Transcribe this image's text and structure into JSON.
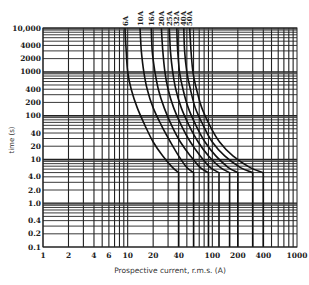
{
  "chart_data": {
    "type": "line",
    "title": "",
    "xlabel": "Prospective current, r.m.s. (A)",
    "ylabel": "time (s)",
    "xscale": "log",
    "yscale": "log",
    "xlim": [
      1,
      1000
    ],
    "ylim": [
      0.1,
      10000
    ],
    "grid": true,
    "legend_position": "curve labels at top",
    "x_tick_labels": [
      "1",
      "2",
      "4",
      "6",
      "10",
      "20",
      "40",
      "100",
      "200",
      "400",
      "1000"
    ],
    "x_ticks": [
      1,
      2,
      4,
      6,
      10,
      20,
      40,
      100,
      200,
      400,
      1000
    ],
    "y_tick_labels": [
      "10,000",
      "4000",
      "2000",
      "1000",
      "400",
      "200",
      "100",
      "40",
      "20",
      "10",
      "4.0",
      "2.0",
      "1.0",
      "0.4",
      "0.2",
      "0.1"
    ],
    "y_ticks": [
      10000,
      4000,
      2000,
      1000,
      400,
      200,
      100,
      40,
      20,
      10,
      4,
      2,
      1,
      0.4,
      0.2,
      0.1
    ],
    "series": [
      {
        "name": "6A",
        "points": [
          [
            9.3,
            10000
          ],
          [
            9.6,
            3000
          ],
          [
            10,
            1000
          ],
          [
            11,
            400
          ],
          [
            13,
            150
          ],
          [
            16,
            60
          ],
          [
            20,
            25
          ],
          [
            26,
            12
          ],
          [
            34,
            6.5
          ],
          [
            40,
            5
          ]
        ],
        "drop_at": 40
      },
      {
        "name": "10A",
        "points": [
          [
            14,
            10000
          ],
          [
            14.5,
            3000
          ],
          [
            15.5,
            1000
          ],
          [
            17,
            400
          ],
          [
            20,
            150
          ],
          [
            25,
            60
          ],
          [
            32,
            25
          ],
          [
            40,
            12
          ],
          [
            50,
            6.5
          ],
          [
            60,
            5
          ]
        ],
        "drop_at": 60
      },
      {
        "name": "16A",
        "points": [
          [
            19,
            10000
          ],
          [
            19.5,
            3000
          ],
          [
            21,
            1000
          ],
          [
            23,
            400
          ],
          [
            27,
            150
          ],
          [
            33,
            60
          ],
          [
            42,
            25
          ],
          [
            55,
            12
          ],
          [
            72,
            6.5
          ],
          [
            90,
            5
          ]
        ],
        "drop_at": 90
      },
      {
        "name": "20A",
        "points": [
          [
            25,
            10000
          ],
          [
            26,
            3000
          ],
          [
            27.5,
            1000
          ],
          [
            30,
            400
          ],
          [
            35,
            150
          ],
          [
            43,
            60
          ],
          [
            55,
            25
          ],
          [
            72,
            12
          ],
          [
            95,
            6.5
          ],
          [
            120,
            5
          ]
        ],
        "drop_at": 120
      },
      {
        "name": "25A",
        "points": [
          [
            31,
            10000
          ],
          [
            32,
            3000
          ],
          [
            34,
            1000
          ],
          [
            37,
            400
          ],
          [
            43,
            150
          ],
          [
            53,
            60
          ],
          [
            68,
            25
          ],
          [
            90,
            12
          ],
          [
            125,
            6.5
          ],
          [
            160,
            5
          ]
        ],
        "drop_at": 160
      },
      {
        "name": "32A",
        "points": [
          [
            38,
            10000
          ],
          [
            39,
            3000
          ],
          [
            41,
            1000
          ],
          [
            45,
            400
          ],
          [
            52,
            150
          ],
          [
            64,
            60
          ],
          [
            82,
            25
          ],
          [
            110,
            12
          ],
          [
            155,
            6.5
          ],
          [
            200,
            5
          ]
        ],
        "drop_at": 200
      },
      {
        "name": "40A",
        "points": [
          [
            46,
            10000
          ],
          [
            47,
            3000
          ],
          [
            50,
            1000
          ],
          [
            55,
            400
          ],
          [
            63,
            150
          ],
          [
            78,
            60
          ],
          [
            100,
            25
          ],
          [
            140,
            12
          ],
          [
            215,
            6.5
          ],
          [
            300,
            5
          ]
        ],
        "drop_at": 300
      },
      {
        "name": "50A",
        "points": [
          [
            54,
            10000
          ],
          [
            56,
            3000
          ],
          [
            59,
            1000
          ],
          [
            65,
            400
          ],
          [
            75,
            150
          ],
          [
            93,
            60
          ],
          [
            122,
            25
          ],
          [
            175,
            12
          ],
          [
            280,
            6.5
          ],
          [
            400,
            5
          ]
        ],
        "drop_at": 400
      }
    ]
  },
  "labels": {
    "xlabel": "Prospective current, r.m.s. (A)",
    "ylabel": "time (s)"
  },
  "colors": {
    "line": "#111111",
    "grid": "#222222",
    "background": "#ffffff"
  }
}
